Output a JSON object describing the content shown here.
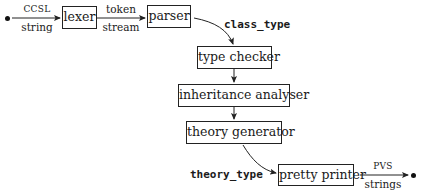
{
  "diagram": {
    "type": "compiler-pipeline",
    "start_node": "start-dot",
    "end_node": "end-dot",
    "nodes": {
      "lexer": "lexer",
      "parser": "parser",
      "type_checker": "type checker",
      "inheritance_analyser": "inheritance analyser",
      "theory_generator": "theory generator",
      "pretty_printer": "pretty printer"
    },
    "edges": {
      "input_top": "CCSL",
      "input_bottom": "string",
      "lexer_parser_top": "token",
      "lexer_parser_bottom": "stream",
      "parser_typechecker": "class_type",
      "generator_printer": "theory_type",
      "output_top": "PVS",
      "output_bottom": "strings"
    },
    "colors": {
      "stroke": "#222222",
      "background": "#ffffff"
    }
  }
}
